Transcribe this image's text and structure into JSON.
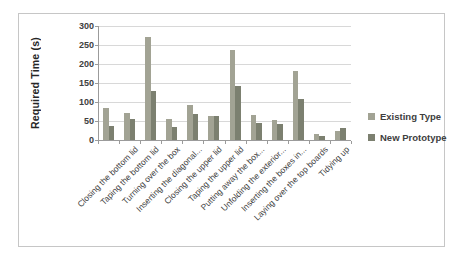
{
  "chart_data": {
    "type": "bar",
    "title": "",
    "ylabel": "Required Time (s)",
    "xlabel": "",
    "ylim": [
      0,
      300
    ],
    "yticks": [
      0,
      50,
      100,
      150,
      200,
      250,
      300
    ],
    "grid": true,
    "legend_position": "right",
    "categories": [
      "",
      "Closing the bottom lid",
      "Taping the bottom lid",
      "Turning over the box",
      "Inserting the diagonal...",
      "Closing the upper lid",
      "Taping the upper lid",
      "Putting away the box...",
      "Unfolding the exterior...",
      "Inserting the boxes in...",
      "Laying over the top boards",
      "Tidying up"
    ],
    "series": [
      {
        "name": "Existing Type",
        "color": "#a2a394",
        "values": [
          85,
          72,
          272,
          54,
          92,
          62,
          236,
          67,
          52,
          182,
          16,
          25
        ]
      },
      {
        "name": "New Prototype",
        "color": "#7c8070",
        "values": [
          38,
          56,
          130,
          34,
          69,
          62,
          142,
          45,
          41,
          108,
          10,
          32
        ]
      }
    ]
  }
}
